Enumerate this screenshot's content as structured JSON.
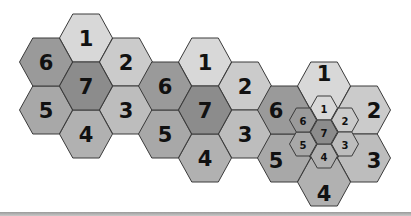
{
  "colors": {
    "1": "#d8d8d8",
    "2": "#cbcbcb",
    "3": "#bdbdbd",
    "4": "#b1b1b1",
    "5": "#a8a8a8",
    "6": "#9a9a9a",
    "7": "#8c8c8c",
    "stroke": "#3a3a3a",
    "text": "#111111"
  },
  "cell_layout": {
    "radius": 26.5,
    "height": 48,
    "offsets": {
      "1": [
        0,
        -48
      ],
      "2": [
        40,
        -24
      ],
      "3": [
        40,
        24
      ],
      "4": [
        0,
        48
      ],
      "5": [
        -40,
        24
      ],
      "6": [
        -40,
        -24
      ],
      "7": [
        0,
        0
      ]
    }
  },
  "clusters": [
    {
      "id": "cluster-1",
      "center": [
        86,
        86
      ],
      "cells": [
        "1",
        "2",
        "3",
        "4",
        "5",
        "6",
        "7"
      ]
    },
    {
      "id": "cluster-2",
      "center": [
        205,
        110
      ],
      "cells": [
        "1",
        "2",
        "3",
        "4",
        "5",
        "6",
        "7"
      ]
    },
    {
      "id": "cluster-3",
      "center": [
        324,
        134
      ],
      "cells": [
        "1",
        "2",
        "3",
        "4",
        "5",
        "6",
        "7"
      ],
      "label_offsets": {
        "1": [
          0,
          -12
        ],
        "2": [
          18,
          0
        ],
        "3": [
          18,
          2
        ],
        "4": [
          0,
          8
        ],
        "5": [
          -18,
          2
        ],
        "6": [
          -18,
          0
        ],
        "7": [
          0,
          0
        ]
      },
      "subcluster": {
        "center": [
          324,
          132
        ],
        "radius": 13.5,
        "height": 24,
        "offsets": {
          "1": [
            0,
            -24
          ],
          "2": [
            21,
            -12
          ],
          "3": [
            21,
            12
          ],
          "4": [
            0,
            24
          ],
          "5": [
            -21,
            12
          ],
          "6": [
            -21,
            -12
          ],
          "7": [
            0,
            0
          ]
        },
        "cells": [
          "1",
          "2",
          "3",
          "4",
          "5",
          "6",
          "7"
        ]
      }
    }
  ]
}
